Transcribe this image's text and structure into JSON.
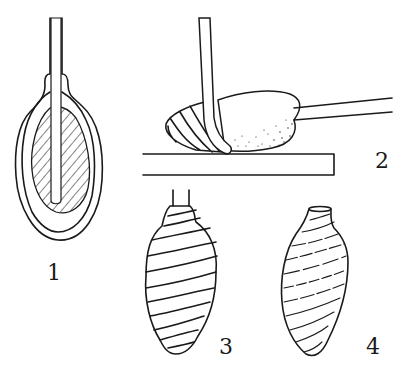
{
  "figure": {
    "panels": [
      {
        "id": "1",
        "label": "1",
        "description": "Longitudinal section: hatched core with central rod inside an oval outer wall with open neck"
      },
      {
        "id": "2",
        "label": "2",
        "description": "Side view: bent rod wrapping coils around stippled oval body on a flat plate, straight rod extending right"
      },
      {
        "id": "3",
        "label": "3",
        "description": "Coiled, segmented spindle form with rod stub at top"
      },
      {
        "id": "4",
        "label": "4",
        "description": "Smooth vase-shaped form with faint spiral banding and open top rim"
      }
    ]
  },
  "colors": {
    "ink": "#1a1a1a",
    "paper": "#ffffff"
  }
}
